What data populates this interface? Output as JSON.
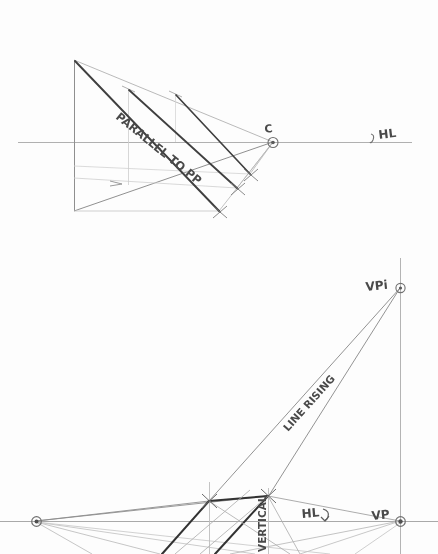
{
  "drawing": {
    "title": "Hand-drawn two-point perspective construction sheet",
    "medium": "pencil on white paper",
    "ink_color": "#6b6b6b",
    "bold_ink_color": "#3a3a3a",
    "light_ink_color": "#b9b9b9",
    "paper_color": "#fdfdfd"
  },
  "upper_diagram": {
    "name": "plan-view-parallel-to-picture-plane",
    "labels": {
      "parallel_to_pp": "PARALLEL TO PP",
      "station_point": "C",
      "horizon_line": "HL"
    },
    "horizon_y": 142,
    "points": {
      "apex_top_left": [
        74,
        60
      ],
      "base_bottom_left": [
        74,
        211
      ],
      "convergence_c": [
        273,
        142
      ],
      "tick_top_mid": [
        128,
        89
      ],
      "tick_top_right": [
        175,
        94
      ],
      "bold_end_1": [
        219,
        211
      ],
      "bold_end_2": [
        237,
        188
      ],
      "bold_end_3": [
        250,
        174
      ]
    }
  },
  "lower_diagram": {
    "name": "elevation-view-line-rising",
    "labels": {
      "vanishing_point_inclined": "VPi",
      "vanishing_point": "VP",
      "horizon_line": "HL",
      "line_rising": "LINE RISING",
      "vertical": "VERTICAL"
    },
    "horizon_y": 521,
    "points": {
      "vpi": [
        400,
        287
      ],
      "vp": [
        400,
        521
      ],
      "left_vp": [
        36,
        521
      ],
      "bold_node_left": [
        209,
        501
      ],
      "bold_node_right": [
        268,
        496
      ]
    }
  }
}
